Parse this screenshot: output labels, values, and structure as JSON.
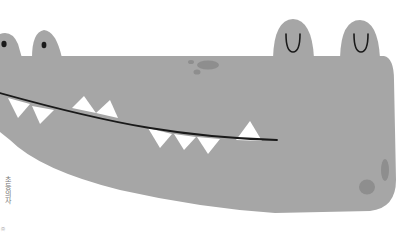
{
  "illustration": {
    "subject": "crocodile head",
    "colors": {
      "skin": "#a6a6a6",
      "spots": "#8e8e8e",
      "teeth": "#ffffff",
      "outline": "#1a1a1a",
      "background": "#ffffff"
    }
  },
  "caption": {
    "text": "초등의자",
    "sub": "㈜"
  }
}
